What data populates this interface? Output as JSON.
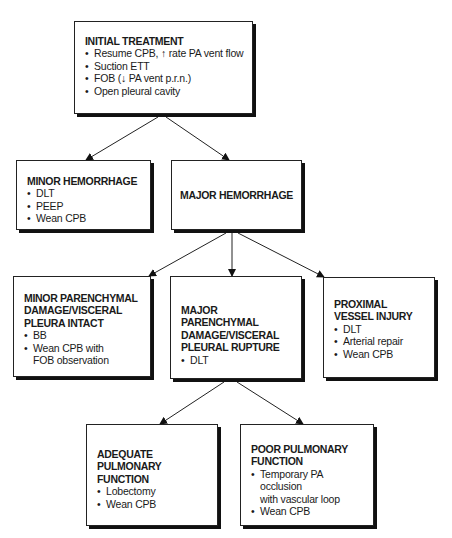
{
  "diagram": {
    "nodes": {
      "initial": {
        "title": "INITIAL TREATMENT",
        "items": [
          "Resume CPB, ↑ rate PA vent flow",
          "Suction ETT",
          "FOB (↓ PA vent p.r.n.)",
          "Open pleural cavity"
        ]
      },
      "minor_hemorrhage": {
        "title": "MINOR HEMORRHAGE",
        "items": [
          "DLT",
          "PEEP",
          "Wean CPB"
        ]
      },
      "major_hemorrhage": {
        "title": "MAJOR HEMORRHAGE",
        "items": []
      },
      "minor_parenchymal": {
        "title_lines": [
          "MINOR PARENCHYMAL",
          "DAMAGE/VISCERAL",
          "PLEURA INTACT"
        ],
        "items": [
          "BB",
          "Wean CPB with",
          "FOB observation"
        ]
      },
      "major_parenchymal": {
        "title_lines": [
          "MAJOR PARENCHYMAL",
          "DAMAGE/VISCERAL",
          "PLEURAL RUPTURE"
        ],
        "items": [
          "DLT"
        ]
      },
      "proximal_vessel": {
        "title_lines": [
          "PROXIMAL",
          "VESSEL INJURY"
        ],
        "items": [
          "DLT",
          "Arterial repair",
          "Wean CPB"
        ]
      },
      "adequate_pulmonary": {
        "title_lines": [
          "ADEQUATE PULMONARY",
          "FUNCTION"
        ],
        "items": [
          "Lobectomy",
          "Wean CPB"
        ]
      },
      "poor_pulmonary": {
        "title_lines": [
          "POOR PULMONARY",
          "FUNCTION"
        ],
        "items": [
          "Temporary PA occlusion",
          "with vascular loop",
          "Wean CPB"
        ]
      }
    },
    "edges": [
      {
        "from": "initial",
        "to": "minor_hemorrhage"
      },
      {
        "from": "initial",
        "to": "major_hemorrhage"
      },
      {
        "from": "major_hemorrhage",
        "to": "minor_parenchymal"
      },
      {
        "from": "major_hemorrhage",
        "to": "major_parenchymal"
      },
      {
        "from": "major_hemorrhage",
        "to": "proximal_vessel"
      },
      {
        "from": "major_parenchymal",
        "to": "adequate_pulmonary"
      },
      {
        "from": "major_parenchymal",
        "to": "poor_pulmonary"
      }
    ]
  }
}
